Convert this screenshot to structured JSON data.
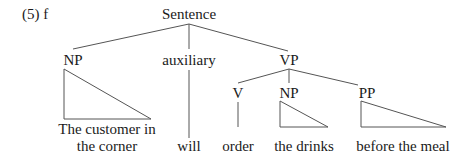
{
  "example_label": "(5) f",
  "tree": {
    "root": "Sentence",
    "children": [
      {
        "label": "NP",
        "leaf": [
          "The customer in",
          "the corner"
        ],
        "triangle": true
      },
      {
        "label": "auxiliary",
        "leaf": [
          "will"
        ],
        "triangle": false
      },
      {
        "label": "VP",
        "children": [
          {
            "label": "V",
            "leaf": [
              "order"
            ],
            "triangle": false
          },
          {
            "label": "NP",
            "leaf": [
              "the drinks"
            ],
            "triangle": true
          },
          {
            "label": "PP",
            "leaf": [
              "before the meal"
            ],
            "triangle": true
          }
        ]
      }
    ]
  },
  "nodes": {
    "root": "Sentence",
    "np_subject": "NP",
    "auxiliary": "auxiliary",
    "vp": "VP",
    "v": "V",
    "np_object": "NP",
    "pp": "PP"
  },
  "leaves": {
    "subject_line1": "The customer in",
    "subject_line2": "the corner",
    "auxiliary": "will",
    "verb": "order",
    "object": "the drinks",
    "pp": "before the meal"
  }
}
